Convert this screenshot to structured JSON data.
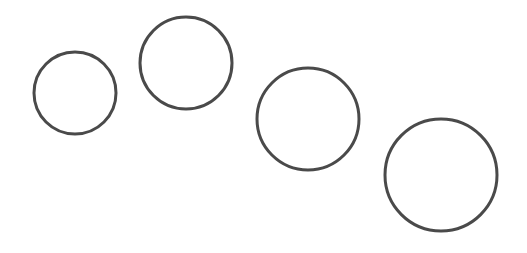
{
  "diagram": {
    "background": "#ffffff",
    "stroke_color": "#4a4a4a",
    "stroke_width": 3,
    "circles": [
      {
        "id": "circle-1",
        "cx": 75,
        "cy": 93,
        "r": 41
      },
      {
        "id": "circle-2",
        "cx": 186,
        "cy": 63,
        "r": 46
      },
      {
        "id": "circle-3",
        "cx": 308,
        "cy": 119,
        "r": 51
      },
      {
        "id": "circle-4",
        "cx": 441,
        "cy": 175,
        "r": 56
      }
    ]
  }
}
